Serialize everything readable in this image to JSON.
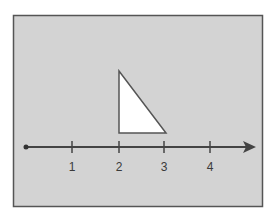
{
  "diagram": {
    "background_color": "#d3d3d3",
    "border_color": "#555555",
    "number_line": {
      "start_marker": "dot",
      "end_marker": "arrow",
      "ticks": [
        {
          "value": 1,
          "label": "1"
        },
        {
          "value": 2,
          "label": "2"
        },
        {
          "value": 3,
          "label": "3"
        },
        {
          "value": 4,
          "label": "4"
        }
      ]
    },
    "shape": {
      "type": "right-triangle",
      "fill": "#ffffff",
      "stroke": "#555555",
      "base_from": 2,
      "base_to": 3,
      "right_angle_at": 2
    }
  }
}
